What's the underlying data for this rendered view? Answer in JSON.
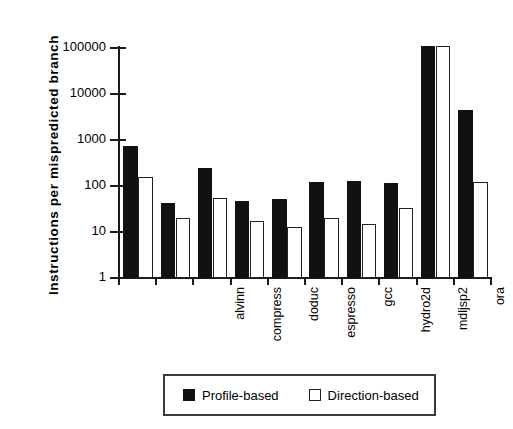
{
  "chart_data": {
    "type": "bar",
    "title": "",
    "xlabel": "",
    "ylabel": "Instructions  per  mispredicted  branch",
    "yscale": "log",
    "ylim": [
      1,
      100000
    ],
    "yticks": [
      1,
      10,
      100,
      1000,
      10000,
      100000
    ],
    "ytick_labels": [
      "1",
      "10",
      "100",
      "1000",
      "10000",
      "100000"
    ],
    "grid": false,
    "legend_position": "bottom-center",
    "categories": [
      "alvinn",
      "compress",
      "doduc",
      "espresso",
      "gcc",
      "hydro2d",
      "mdljsp2",
      "ora",
      "swm256",
      "tomcatv"
    ],
    "series": [
      {
        "name": "Profile-based",
        "color": "#111111",
        "style": "filled",
        "values": [
          750,
          43,
          250,
          47,
          52,
          125,
          130,
          115,
          110000,
          4500
        ]
      },
      {
        "name": "Direction-based",
        "color": "#ffffff",
        "style": "outlined",
        "values": [
          160,
          20,
          55,
          17,
          13,
          20,
          15,
          33,
          110000,
          125
        ]
      }
    ]
  },
  "legend": {
    "items": [
      {
        "label": "Profile-based",
        "swatch": "filled-square-icon"
      },
      {
        "label": "Direction-based",
        "swatch": "empty-square-icon"
      }
    ]
  }
}
